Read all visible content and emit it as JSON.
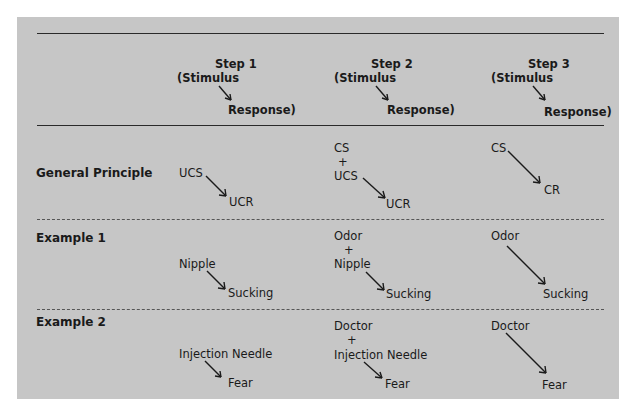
{
  "header": {
    "columns": [
      {
        "step": "Step 1",
        "stimulus": "(Stimulus",
        "response": "Response)"
      },
      {
        "step": "Step 2",
        "stimulus": "(Stimulus",
        "response": "Response)"
      },
      {
        "step": "Step 3",
        "stimulus": "(Stimulus",
        "response": "Response)"
      }
    ]
  },
  "rows": [
    {
      "label": "General Principle",
      "step1": {
        "stimulus": "UCS",
        "response": "UCR"
      },
      "step2": {
        "stimulus_a": "CS",
        "plus": "+",
        "stimulus_b": "UCS",
        "response": "UCR"
      },
      "step3": {
        "stimulus": "CS",
        "response": "CR"
      }
    },
    {
      "label": "Example 1",
      "step1": {
        "stimulus": "Nipple",
        "response": "Sucking"
      },
      "step2": {
        "stimulus_a": "Odor",
        "plus": "+",
        "stimulus_b": "Nipple",
        "response": "Sucking"
      },
      "step3": {
        "stimulus": "Odor",
        "response": "Sucking"
      }
    },
    {
      "label": "Example 2",
      "step1": {
        "stimulus": "Injection Needle",
        "response": "Fear"
      },
      "step2": {
        "stimulus_a": "Doctor",
        "plus": "+",
        "stimulus_b": "Injection Needle",
        "response": "Fear"
      },
      "step3": {
        "stimulus": "Doctor",
        "response": "Fear"
      }
    }
  ],
  "colors": {
    "panel": "#c6c6c6",
    "text": "#1a1a1a"
  }
}
